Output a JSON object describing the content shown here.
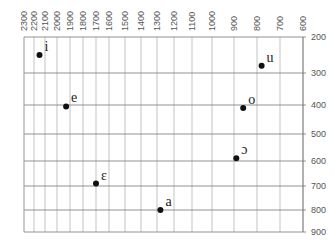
{
  "chart_data": {
    "type": "scatter",
    "title": "",
    "xlabel": "F2 (Hz)",
    "ylabel": "F1 (Hz)",
    "x_axis_position": "top",
    "y_axis_position": "right",
    "x_reversed": true,
    "x_ticks": [
      2300,
      2200,
      2100,
      2000,
      1900,
      1800,
      1700,
      1600,
      1500,
      1400,
      1300,
      1200,
      1100,
      1000,
      900,
      800,
      700,
      600
    ],
    "y_ticks": [
      200,
      300,
      400,
      500,
      600,
      700,
      800,
      900
    ],
    "xlim": [
      2300,
      600
    ],
    "ylim": [
      200,
      900
    ],
    "grid": true,
    "points": [
      {
        "label": "i",
        "f2": 2150,
        "f1": 250
      },
      {
        "label": "e",
        "f2": 1930,
        "f1": 405
      },
      {
        "label": "ɛ",
        "f2": 1700,
        "f1": 690
      },
      {
        "label": "a",
        "f2": 1280,
        "f1": 800
      },
      {
        "label": "ɔ",
        "f2": 890,
        "f1": 590
      },
      {
        "label": "o",
        "f2": 860,
        "f1": 410
      },
      {
        "label": "u",
        "f2": 780,
        "f1": 280
      }
    ],
    "colors": {
      "grid": "#aaaaaa",
      "major_grid": "#777777",
      "point": "#111111",
      "text": "#555555"
    }
  }
}
